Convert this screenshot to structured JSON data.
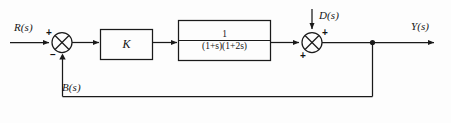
{
  "diagram": {
    "signals": {
      "reference": "R(s)",
      "disturbance": "D(s)",
      "output": "Y(s)",
      "feedback": "B(s)"
    },
    "blocks": [
      {
        "id": "gain",
        "label": "K"
      },
      {
        "id": "plant",
        "numerator": "1",
        "denominator": "(1+s)(1+2s)"
      }
    ],
    "summers": [
      {
        "id": "error-summer",
        "signs": {
          "top_left": "+",
          "bottom": "–"
        }
      },
      {
        "id": "disturbance-summer",
        "signs": {
          "top_right": "+",
          "bottom_left": "+"
        }
      }
    ],
    "colors": {
      "line": "#1a1a1a",
      "text": "#131313",
      "background": "#fdfdfd"
    }
  }
}
